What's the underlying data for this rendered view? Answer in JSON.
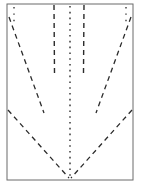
{
  "figure": {
    "type": "technical-line-diagram",
    "canvas": {
      "width": 141,
      "height": 187,
      "background": "#ffffff"
    },
    "frame": {
      "name": "outer-frame",
      "x": 7,
      "y": 4,
      "width": 126,
      "height": 176,
      "stroke": "#6b6b6b",
      "stroke_width": 1,
      "fill": "none"
    },
    "strokes": {
      "dash_color": "#2b2b2b",
      "dot_color": "#3a3a3a",
      "frame_color": "#6b6b6b",
      "dash_pattern": "5 4",
      "dot_pattern": "1.6 4.2",
      "accent_pattern": "1.4 5"
    },
    "elements": [
      {
        "name": "center-dotted-spine",
        "kind": "line",
        "style": "dotted",
        "x1": 70,
        "y1": 6,
        "x2": 70,
        "y2": 178,
        "width": 1.5
      },
      {
        "name": "left-inner-dashed-vertical",
        "kind": "line",
        "style": "dashed",
        "x1": 54,
        "y1": 5,
        "x2": 54.5,
        "y2": 73,
        "width": 1.4
      },
      {
        "name": "right-inner-dashed-vertical",
        "kind": "line",
        "style": "dashed",
        "x1": 84,
        "y1": 5,
        "x2": 83.5,
        "y2": 73,
        "width": 1.4
      },
      {
        "name": "left-inner-diagonal",
        "kind": "line",
        "style": "dashed",
        "x1": 9,
        "y1": 17,
        "x2": 44,
        "y2": 113,
        "width": 1.3
      },
      {
        "name": "right-inner-diagonal",
        "kind": "line",
        "style": "dashed",
        "x1": 131,
        "y1": 17,
        "x2": 96,
        "y2": 113,
        "width": 1.3
      },
      {
        "name": "left-v-arm",
        "kind": "line",
        "style": "dashed",
        "x1": 8,
        "y1": 110,
        "x2": 69,
        "y2": 178,
        "width": 1.3
      },
      {
        "name": "right-v-arm",
        "kind": "line",
        "style": "dashed",
        "x1": 132,
        "y1": 110,
        "x2": 71,
        "y2": 178,
        "width": 1.3
      },
      {
        "name": "top-left-accent-dots",
        "kind": "line",
        "style": "dotted-accent",
        "x1": 14,
        "y1": 7,
        "x2": 14,
        "y2": 22,
        "width": 1.4
      },
      {
        "name": "top-right-accent-dots",
        "kind": "line",
        "style": "dotted-accent",
        "x1": 126,
        "y1": 7,
        "x2": 126,
        "y2": 22,
        "width": 1.4
      }
    ],
    "apex": {
      "name": "v-apex",
      "x": 70,
      "y": 178
    }
  }
}
